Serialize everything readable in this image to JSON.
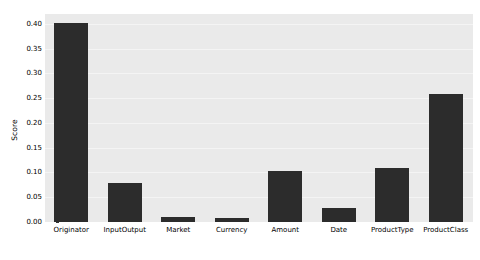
{
  "chart_data": {
    "type": "bar",
    "title": "",
    "subtitle": "",
    "xlabel": "",
    "ylabel": "Score",
    "categories": [
      "Originator",
      "InputOutput",
      "Market",
      "Currency",
      "Amount",
      "Date",
      "ProductType",
      "ProductClass"
    ],
    "values": [
      0.401,
      0.078,
      0.011,
      0.009,
      0.104,
      0.028,
      0.11,
      0.259
    ],
    "ylim": [
      0.0,
      0.42
    ],
    "yticks": [
      0.0,
      0.05,
      0.1,
      0.15,
      0.2,
      0.25,
      0.3,
      0.35,
      0.4
    ],
    "ytick_labels": [
      "0.00",
      "0.05",
      "0.10",
      "0.15",
      "0.20",
      "0.25",
      "0.30",
      "0.35",
      "0.40"
    ],
    "grid": true,
    "grid_axis": "y",
    "legend": null,
    "legend_position": "none",
    "bar_color": "#2c2c2c",
    "plot_background": "#eaeaea",
    "figure_background": "#ffffff",
    "gridline_color": "#f4f4f4"
  }
}
